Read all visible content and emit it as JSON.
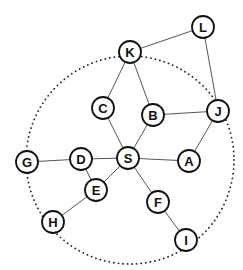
{
  "diagram": {
    "type": "graph",
    "ring": {
      "cx": 130,
      "cy": 160,
      "r": 104
    },
    "nodes": [
      {
        "id": "L",
        "label": "L",
        "x": 203,
        "y": 27
      },
      {
        "id": "K",
        "label": "K",
        "x": 130,
        "y": 52
      },
      {
        "id": "C",
        "label": "C",
        "x": 103,
        "y": 108
      },
      {
        "id": "B",
        "label": "B",
        "x": 153,
        "y": 115
      },
      {
        "id": "J",
        "label": "J",
        "x": 218,
        "y": 111
      },
      {
        "id": "S",
        "label": "S",
        "x": 128,
        "y": 158
      },
      {
        "id": "A",
        "label": "A",
        "x": 189,
        "y": 161
      },
      {
        "id": "D",
        "label": "D",
        "x": 81,
        "y": 159
      },
      {
        "id": "G",
        "label": "G",
        "x": 27,
        "y": 162
      },
      {
        "id": "E",
        "label": "E",
        "x": 96,
        "y": 190
      },
      {
        "id": "F",
        "label": "F",
        "x": 158,
        "y": 202
      },
      {
        "id": "H",
        "label": "H",
        "x": 53,
        "y": 222
      },
      {
        "id": "I",
        "label": "I",
        "x": 186,
        "y": 240
      }
    ],
    "edges": [
      [
        "K",
        "L"
      ],
      [
        "L",
        "J"
      ],
      [
        "K",
        "C"
      ],
      [
        "K",
        "B"
      ],
      [
        "B",
        "J"
      ],
      [
        "J",
        "A"
      ],
      [
        "C",
        "S"
      ],
      [
        "B",
        "S"
      ],
      [
        "S",
        "A"
      ],
      [
        "S",
        "D"
      ],
      [
        "D",
        "G"
      ],
      [
        "D",
        "E"
      ],
      [
        "E",
        "S"
      ],
      [
        "E",
        "H"
      ],
      [
        "S",
        "F"
      ],
      [
        "F",
        "I"
      ]
    ]
  }
}
